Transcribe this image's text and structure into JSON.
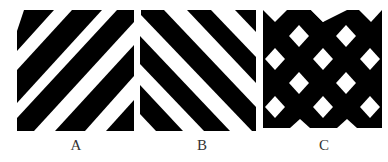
{
  "figure": {
    "colors": {
      "foreground": "#000000",
      "background": "#ffffff",
      "label": "#333333"
    },
    "panels": [
      {
        "id": "A",
        "label": "A",
        "pattern": "diagonal-stripes",
        "direction": "lower-left to upper-right (/)"
      },
      {
        "id": "B",
        "label": "B",
        "pattern": "diagonal-stripes",
        "direction": "upper-left to lower-right (\\)"
      },
      {
        "id": "C",
        "label": "C",
        "pattern": "black field with staggered white diamonds"
      }
    ]
  }
}
